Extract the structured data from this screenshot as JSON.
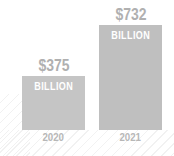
{
  "chart_data": {
    "type": "bar",
    "categories": [
      "2020",
      "2021"
    ],
    "values": [
      375,
      732
    ],
    "value_labels": [
      "$375",
      "$732"
    ],
    "value_sublabels": [
      "BILLION",
      "BILLION"
    ],
    "title": "",
    "xlabel": "",
    "ylabel": "",
    "ylim": [
      0,
      800
    ],
    "unit": "billion dollars",
    "grid": false,
    "legend": false
  },
  "colors": {
    "background": "#ffffff",
    "bar_colors": [
      "#c5c5c5",
      "#bfbfbf"
    ],
    "value_label": "#b0b0b0",
    "bar_sublabel": "#ffffff",
    "year_label": "#b7b7b7",
    "texture_line": "#e9e9e9"
  }
}
